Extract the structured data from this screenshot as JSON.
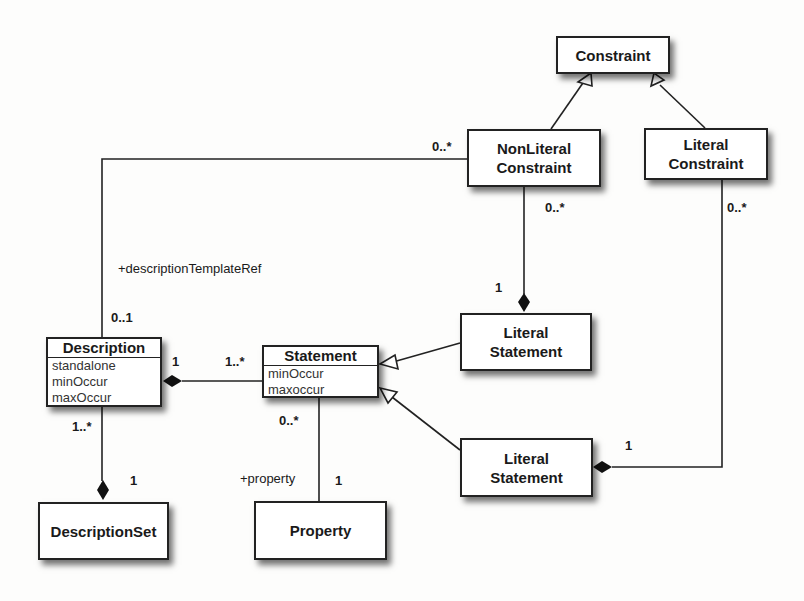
{
  "classes": {
    "constraint": {
      "name": "Constraint"
    },
    "nonliteral_constraint": {
      "line1": "NonLiteral",
      "line2": "Constraint"
    },
    "literal_constraint": {
      "line1": "Literal",
      "line2": "Constraint"
    },
    "literal_statement_upper": {
      "line1": "Literal",
      "line2": "Statement"
    },
    "literal_statement_lower": {
      "line1": "Literal",
      "line2": "Statement"
    },
    "description": {
      "name": "Description",
      "attributes": [
        "standalone",
        "minOccur",
        "maxOccur"
      ]
    },
    "statement": {
      "name": "Statement",
      "attributes": [
        "minOccur",
        "maxoccur"
      ]
    },
    "description_set": {
      "name": "DescriptionSet"
    },
    "property": {
      "name": "Property"
    }
  },
  "labels": {
    "nonliteral_desc_mult": "0..*",
    "nonliteral_litstmt_mult": "0..*",
    "litstmt_upper_mult": "1",
    "literal_constraint_mult": "0..*",
    "litstmt_lower_mult": "1",
    "description_template_role": "+descriptionTemplateRef",
    "description_template_mult": "0..1",
    "description_statement_mult_desc": "1",
    "description_statement_mult_stmt": "1..*",
    "description_descset_mult_desc": "1..*",
    "description_descset_mult_set": "1",
    "statement_property_mult": "0..*",
    "property_role": "+property",
    "property_mult": "1"
  }
}
